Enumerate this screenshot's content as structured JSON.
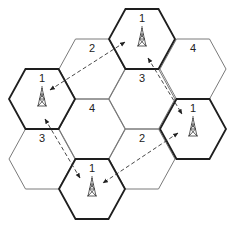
{
  "diagram": {
    "type": "hexagonal cellular frequency reuse pattern",
    "cluster_size": 4,
    "cell_edge_px": 33,
    "colors": {
      "co_channel_border": "#1e1e1e",
      "cell_border": "#7a7a7a",
      "arrow": "#333333"
    },
    "cells": [
      {
        "id": "c0",
        "label": "",
        "cx": 42,
        "cy": 39,
        "bold": false,
        "tower": false,
        "visible": false
      },
      {
        "id": "c1",
        "label": "1",
        "cx": 42,
        "cy": 99,
        "bold": true,
        "tower": true
      },
      {
        "id": "c2",
        "label": "3",
        "cx": 42,
        "cy": 159,
        "bold": false,
        "tower": false
      },
      {
        "id": "c3",
        "label": "2",
        "cx": 92,
        "cy": 69,
        "bold": false,
        "tower": false
      },
      {
        "id": "c4",
        "label": "4",
        "cx": 92,
        "cy": 129,
        "bold": false,
        "tower": false
      },
      {
        "id": "c5",
        "label": "1",
        "cx": 92,
        "cy": 189,
        "bold": true,
        "tower": true
      },
      {
        "id": "c6",
        "label": "1",
        "cx": 142,
        "cy": 39,
        "bold": true,
        "tower": true
      },
      {
        "id": "c7",
        "label": "3",
        "cx": 142,
        "cy": 99,
        "bold": false,
        "tower": false
      },
      {
        "id": "c8",
        "label": "2",
        "cx": 142,
        "cy": 159,
        "bold": false,
        "tower": false
      },
      {
        "id": "c9",
        "label": "4",
        "cx": 193,
        "cy": 69,
        "bold": false,
        "tower": false
      },
      {
        "id": "c10",
        "label": "1",
        "cx": 193,
        "cy": 129,
        "bold": true,
        "tower": true
      }
    ],
    "arrows": [
      {
        "id": "left-to-top",
        "x1": 50,
        "y1": 90,
        "x2": 125,
        "y2": 42
      },
      {
        "id": "top-to-right",
        "x1": 148,
        "y1": 58,
        "x2": 182,
        "y2": 114
      },
      {
        "id": "right-to-bottom",
        "x1": 178,
        "y1": 133,
        "x2": 103,
        "y2": 183
      },
      {
        "id": "left-to-bottom",
        "x1": 45,
        "y1": 119,
        "x2": 80,
        "y2": 178
      }
    ]
  }
}
